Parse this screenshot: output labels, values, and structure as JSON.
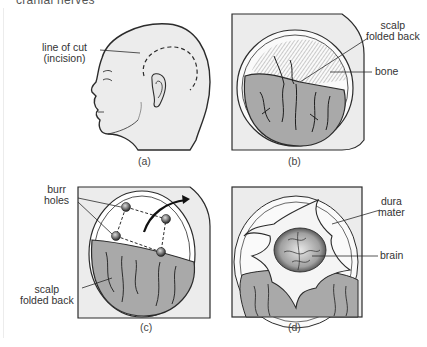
{
  "heading": "cranial nerves",
  "panels": [
    {
      "id": "a",
      "caption": "(a)",
      "labels": [
        {
          "line1": "line of cut",
          "line2": "(incision)"
        }
      ]
    },
    {
      "id": "b",
      "caption": "(b)",
      "labels": [
        {
          "line1": "scalp",
          "line2": "folded back"
        },
        {
          "line1": "bone"
        }
      ]
    },
    {
      "id": "c",
      "caption": "(c)",
      "labels": [
        {
          "line1": "burr",
          "line2": "holes"
        },
        {
          "line1": "scalp",
          "line2": "folded back"
        }
      ]
    },
    {
      "id": "d",
      "caption": "(d)",
      "labels": [
        {
          "line1": "dura",
          "line2": "mater"
        },
        {
          "line1": "brain"
        }
      ]
    }
  ],
  "colors": {
    "skin": "#ececec",
    "scalp": "#a9a9a9",
    "line": "#2b2b2b"
  }
}
